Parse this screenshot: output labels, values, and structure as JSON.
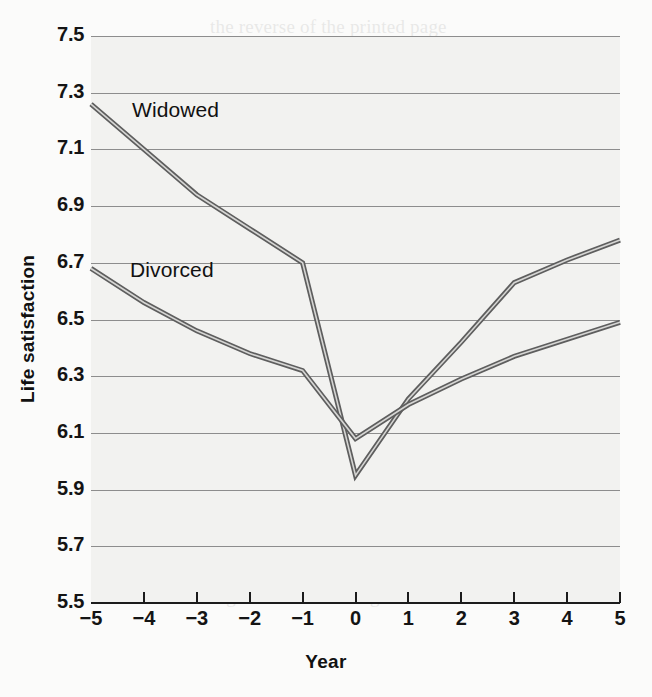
{
  "chart_data": {
    "type": "line",
    "title": "",
    "xlabel": "Year",
    "ylabel": "Life satisfaction",
    "x": [
      -5,
      -4,
      -3,
      -2,
      -1,
      0,
      1,
      2,
      3,
      4,
      5
    ],
    "xtick_labels": [
      "−5",
      "−4",
      "−3",
      "−2",
      "−1",
      "0",
      "1",
      "2",
      "3",
      "4",
      "5"
    ],
    "ytick_labels": [
      "7.5",
      "7.3",
      "7.1",
      "6.9",
      "6.7",
      "6.5",
      "6.3",
      "6.1",
      "5.9",
      "5.7",
      "5.5"
    ],
    "ytick_values": [
      7.5,
      7.3,
      7.1,
      6.9,
      6.7,
      6.5,
      6.3,
      6.1,
      5.9,
      5.7,
      5.5
    ],
    "xlim": [
      -5,
      5
    ],
    "ylim": [
      5.5,
      7.5
    ],
    "grid": "horizontal",
    "legend": "inline-labels",
    "series": [
      {
        "name": "Widowed",
        "color": "#8a8a8a",
        "values": [
          7.26,
          7.1,
          6.94,
          6.82,
          6.7,
          5.95,
          6.22,
          6.42,
          6.63,
          6.71,
          6.78
        ]
      },
      {
        "name": "Divorced",
        "color": "#9a9a9a",
        "values": [
          6.68,
          6.56,
          6.46,
          6.38,
          6.32,
          6.08,
          6.2,
          6.29,
          6.37,
          6.43,
          6.49
        ]
      }
    ],
    "annotations": [
      {
        "text": "Widowed",
        "x": -4.2,
        "y": 7.25
      },
      {
        "text": "Divorced",
        "x": -4.2,
        "y": 6.66
      }
    ]
  },
  "colors": {
    "plot_background": "#f2f2f0",
    "page_background": "#fbfbfa",
    "gridline": "#8d8d8d",
    "axis": "#1c1c1c",
    "text": "#141414",
    "series_widowed": "#8a8a8a",
    "series_divorced": "#9a9a9a"
  },
  "page_bleed_text": [
    "the reverse of the printed page",
    "faint show-through of body text",
    "t) research on happiness is difficult. Life",
    "certainty, you sometimes show how",
    "ment the sensitivity to a variable",
    "deter may Probably a lot, but in our",
    "these the possibly happen rather those",
    "ets are not on the part of the variables",
    "and the analysis measuring and",
    "it is over the consider under rating",
    "as the it is the results for the findings",
    "some questions (Diener & Lucas, 2000)",
    "and the consequences given in the",
    "that satisfaction to over life increases",
    "think a change in a certain position",
    "Figure 8.2 illustrating the results of the"
  ]
}
